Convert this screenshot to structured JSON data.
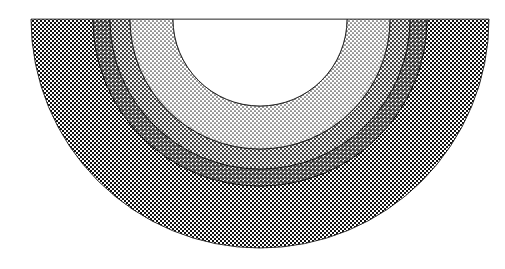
{
  "figure": {
    "background_color": "#ffffff",
    "stroke_color": "#1a1a1a",
    "canvas": {
      "width": 505,
      "height": 269
    }
  },
  "chart_data": {
    "type": "pie",
    "subtype": "half-annulus concentric zones",
    "title": "",
    "subtitle": "",
    "xlabel": "",
    "ylabel": "",
    "grid": false,
    "legend_position": "none",
    "orientation": "semicircle-downward",
    "center": {
      "x": 260,
      "y": 19
    },
    "sweep": {
      "start_angle_deg": 0,
      "end_angle_deg": 180
    },
    "outer_radius": 229,
    "axis_line": {
      "label": "diameter-baseline",
      "x1": 31,
      "y1": 19,
      "x2": 489,
      "y2": 19,
      "visible": true
    },
    "categories": [
      "core",
      "zone-1",
      "zone-2",
      "zone-3",
      "zone-4"
    ],
    "values": [
      87,
      43,
      20,
      17,
      62
    ],
    "bands": [
      {
        "name": "core",
        "label": "inner core",
        "inner_radius": 0,
        "outer_radius": 87,
        "thickness": 87,
        "fill": "none",
        "fill_color": "#ffffff",
        "pattern": "none",
        "tone_percent": 0,
        "outlined": true
      },
      {
        "name": "zone-1",
        "label": "lightest stipple band",
        "inner_radius": 87,
        "outer_radius": 130,
        "thickness": 43,
        "fill": "halftone-dots",
        "fill_color": "#f2f2f2",
        "dot_color": "#3d3d3d",
        "pattern": "fine-dot",
        "dot_spacing": 4,
        "dot_radius": 0.85,
        "tone_percent": 14,
        "outlined": true
      },
      {
        "name": "zone-2",
        "label": "light stipple band",
        "inner_radius": 130,
        "outer_radius": 150,
        "thickness": 20,
        "fill": "halftone-dots",
        "fill_color": "#e8e8e8",
        "dot_color": "#333333",
        "pattern": "medium-dot",
        "dot_spacing": 4,
        "dot_radius": 1.15,
        "tone_percent": 24,
        "outlined": true
      },
      {
        "name": "zone-3",
        "label": "medium stipple band",
        "inner_radius": 150,
        "outer_radius": 167,
        "thickness": 17,
        "fill": "halftone-dots",
        "fill_color": "#dcdcdc",
        "dot_color": "#2b2b2b",
        "pattern": "coarse-dot",
        "dot_spacing": 4,
        "dot_radius": 1.45,
        "tone_percent": 40,
        "outlined": true
      },
      {
        "name": "zone-4",
        "label": "darkest checker band",
        "inner_radius": 167,
        "outer_radius": 229,
        "thickness": 62,
        "fill": "checkerboard",
        "fill_color": "#4a4a4a",
        "dot_color": "#111111",
        "pattern": "checker",
        "dot_spacing": 4,
        "dot_radius": 2.0,
        "tone_percent": 52,
        "outlined": true
      }
    ],
    "boundary_radii": [
      87,
      130,
      150,
      167,
      229
    ]
  }
}
